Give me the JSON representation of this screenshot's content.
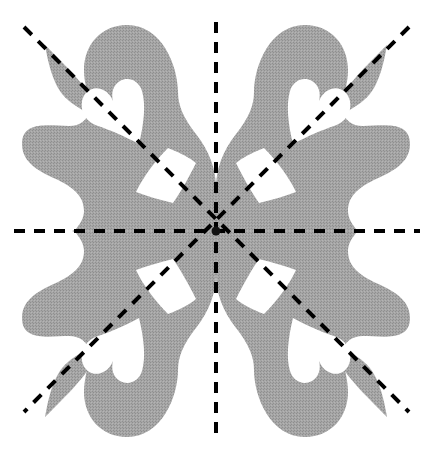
{
  "figure": {
    "canvas": {
      "width": 433,
      "height": 463,
      "background": "#ffffff"
    },
    "center": {
      "x": 216,
      "y": 231
    },
    "region": {
      "name": "shaded-region",
      "fill": "#a0a0a0",
      "description": "Scalloped four-fold symmetric shaded region with spikes toward the diagonals and rounded lobes along the axes"
    },
    "holes": {
      "heart": {
        "name": "heart-hole",
        "count": 4,
        "fill": "#ffffff",
        "description": "Heart / teardrop shaped white hole, cusp pointing toward the centre along each diagonal"
      },
      "kite": {
        "name": "kite-hole",
        "count": 4,
        "fill": "#ffffff",
        "description": "Curved quadrilateral (kite) white hole adjacent to the centre in each quadrant"
      }
    },
    "mirror_lines": {
      "name": "mirror-lines",
      "count": 4,
      "color": "#000000",
      "stroke_width": 4,
      "dash": "11 9",
      "lines": [
        {
          "id": "horizontal",
          "label": "horizontal mirror",
          "x1": 14,
          "y1": 231,
          "x2": 420,
          "y2": 231
        },
        {
          "id": "vertical",
          "label": "vertical mirror",
          "x1": 216,
          "y1": 22,
          "x2": 216,
          "y2": 441
        },
        {
          "id": "diagonal-nw-se",
          "label": "diagonal mirror NW-SE",
          "x1": 24,
          "y1": 27,
          "x2": 409,
          "y2": 412
        },
        {
          "id": "diagonal-ne-sw",
          "label": "diagonal mirror NE-SW",
          "x1": 409,
          "y1": 27,
          "x2": 24,
          "y2": 412
        }
      ]
    },
    "caption": ""
  }
}
